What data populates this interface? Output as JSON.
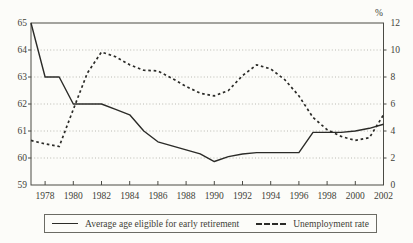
{
  "colors": {
    "background": "#fcfcf9",
    "line": "#2b2b28",
    "grid": "#b2b2aa",
    "axis": "#4a4a44",
    "text": "#3f3f38"
  },
  "chart_data": {
    "type": "line",
    "title": "",
    "years": [
      1977,
      1978,
      1979,
      1980,
      1981,
      1982,
      1983,
      1984,
      1985,
      1986,
      1987,
      1988,
      1989,
      1990,
      1991,
      1992,
      1993,
      1994,
      1995,
      1996,
      1997,
      1998,
      1999,
      2000,
      2001,
      2002
    ],
    "x_tick_labels": [
      "1978",
      "1980",
      "1982",
      "1984",
      "1986",
      "1988",
      "1990",
      "1992",
      "1994",
      "1996",
      "1998",
      "2000",
      "2002"
    ],
    "series": [
      {
        "name": "Average age eligible for early retirement",
        "axis": "left",
        "line_style": "solid",
        "color": "#2b2b28",
        "values": [
          65,
          63,
          63,
          62,
          62,
          62,
          61.8,
          61.6,
          61.0,
          60.6,
          60.45,
          60.3,
          60.15,
          59.87,
          60.05,
          60.15,
          60.2,
          60.2,
          60.2,
          60.2,
          60.95,
          60.95,
          60.95,
          61.0,
          61.1,
          61.25
        ]
      },
      {
        "name": "Unemployment rate",
        "axis": "right",
        "line_style": "dashed",
        "color": "#2b2b28",
        "values": [
          3.3,
          3.05,
          2.85,
          5.6,
          8.3,
          9.85,
          9.5,
          8.9,
          8.5,
          8.45,
          7.9,
          7.3,
          6.8,
          6.6,
          7.0,
          8.1,
          8.9,
          8.6,
          7.8,
          6.6,
          5.0,
          4.1,
          3.6,
          3.3,
          3.5,
          5.2
        ]
      }
    ],
    "left_axis": {
      "min": 59,
      "max": 65,
      "ticks": [
        "65",
        "64",
        "63",
        "62",
        "61",
        "60",
        "59"
      ]
    },
    "right_axis": {
      "min": 0,
      "max": 12,
      "ticks": [
        "12",
        "10",
        "8",
        "6",
        "4",
        "2",
        "0"
      ],
      "unit_label": "%"
    },
    "grid": {
      "horizontal": true,
      "style": "dotted"
    },
    "legend_position": "bottom"
  }
}
